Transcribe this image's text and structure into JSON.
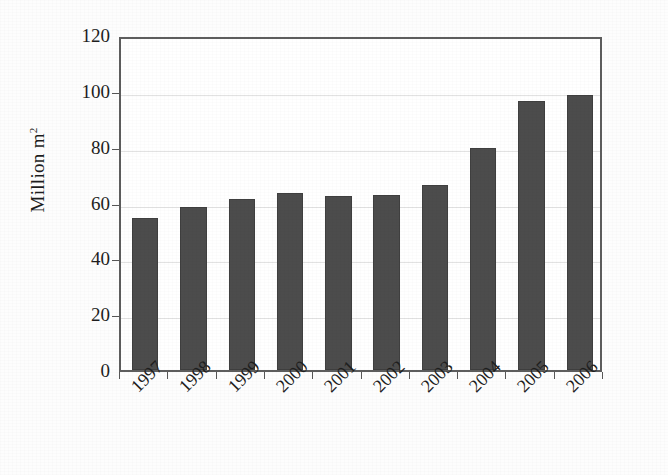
{
  "chart_data": {
    "type": "bar",
    "title": "",
    "subtitle": "",
    "xlabel": "",
    "ylabel": "Million m²",
    "ylabel_base": "Million m",
    "ylabel_sup": "2",
    "categories": [
      "1997",
      "1998",
      "1999",
      "2000",
      "2001",
      "2002",
      "2003",
      "2004",
      "2005",
      "2006"
    ],
    "values": [
      54.5,
      58.5,
      61.2,
      63.5,
      62.5,
      62.6,
      66.2,
      79.7,
      96.4,
      98.4
    ],
    "ylim": [
      0,
      120
    ],
    "ytick_labels": [
      "0",
      "20",
      "40",
      "60",
      "80",
      "100",
      "120"
    ],
    "ytick_values": [
      0,
      20,
      40,
      60,
      80,
      100,
      120
    ],
    "grid": "horizontal",
    "legend": "none",
    "series_name": "",
    "colors": {
      "bar_fill": "#4c4c4c",
      "bar_edge": "#3f3f3f",
      "axis": "#5d5d5d",
      "gridline": "#e2e2e2",
      "text": "#1e1e1e",
      "background": "#fdfdfd",
      "plot_background": "#ffffff"
    }
  }
}
